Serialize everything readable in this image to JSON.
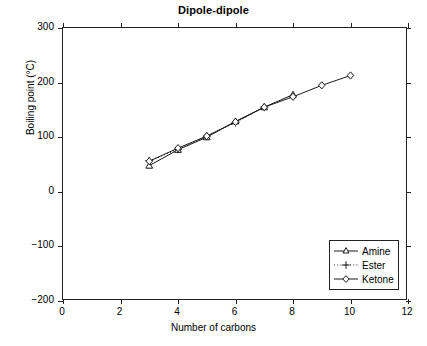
{
  "chart_data": {
    "type": "line",
    "title": "Dipole-dipole",
    "xlabel": "Number of carbons",
    "ylabel": "Boiling point (°C)",
    "xlim": [
      0,
      12
    ],
    "ylim": [
      -200,
      300
    ],
    "xticks": [
      0,
      2,
      4,
      6,
      8,
      10,
      12
    ],
    "yticks": [
      -200,
      -100,
      0,
      100,
      200,
      300
    ],
    "xtick_labels": [
      "0",
      "2",
      "4",
      "6",
      "8",
      "10",
      "12"
    ],
    "ytick_labels": [
      "-200",
      "-100",
      "0",
      "100",
      "200",
      "300"
    ],
    "grid": false,
    "legend_position": "lower right",
    "series": [
      {
        "name": "Amine",
        "marker": "triangle",
        "linestyle": "solid",
        "color": "#1a1a1a",
        "x": [
          3,
          4,
          5,
          6,
          7,
          8
        ],
        "y": [
          48,
          77,
          100,
          129,
          155,
          178
        ]
      },
      {
        "name": "Ester",
        "marker": "plus",
        "linestyle": "dotted",
        "color": "#1a1a1a",
        "x": [
          3,
          4,
          5,
          6,
          7
        ],
        "y": [
          57,
          78,
          102,
          127,
          155
        ]
      },
      {
        "name": "Ketone",
        "marker": "diamond",
        "linestyle": "solid",
        "color": "#1a1a1a",
        "x": [
          3,
          4,
          5,
          6,
          7,
          8,
          9,
          10
        ],
        "y": [
          56,
          80,
          102,
          128,
          155,
          174,
          195,
          213
        ]
      }
    ]
  },
  "legend": {
    "items": [
      {
        "label": "Amine"
      },
      {
        "label": "Ester"
      },
      {
        "label": "Ketone"
      }
    ]
  }
}
